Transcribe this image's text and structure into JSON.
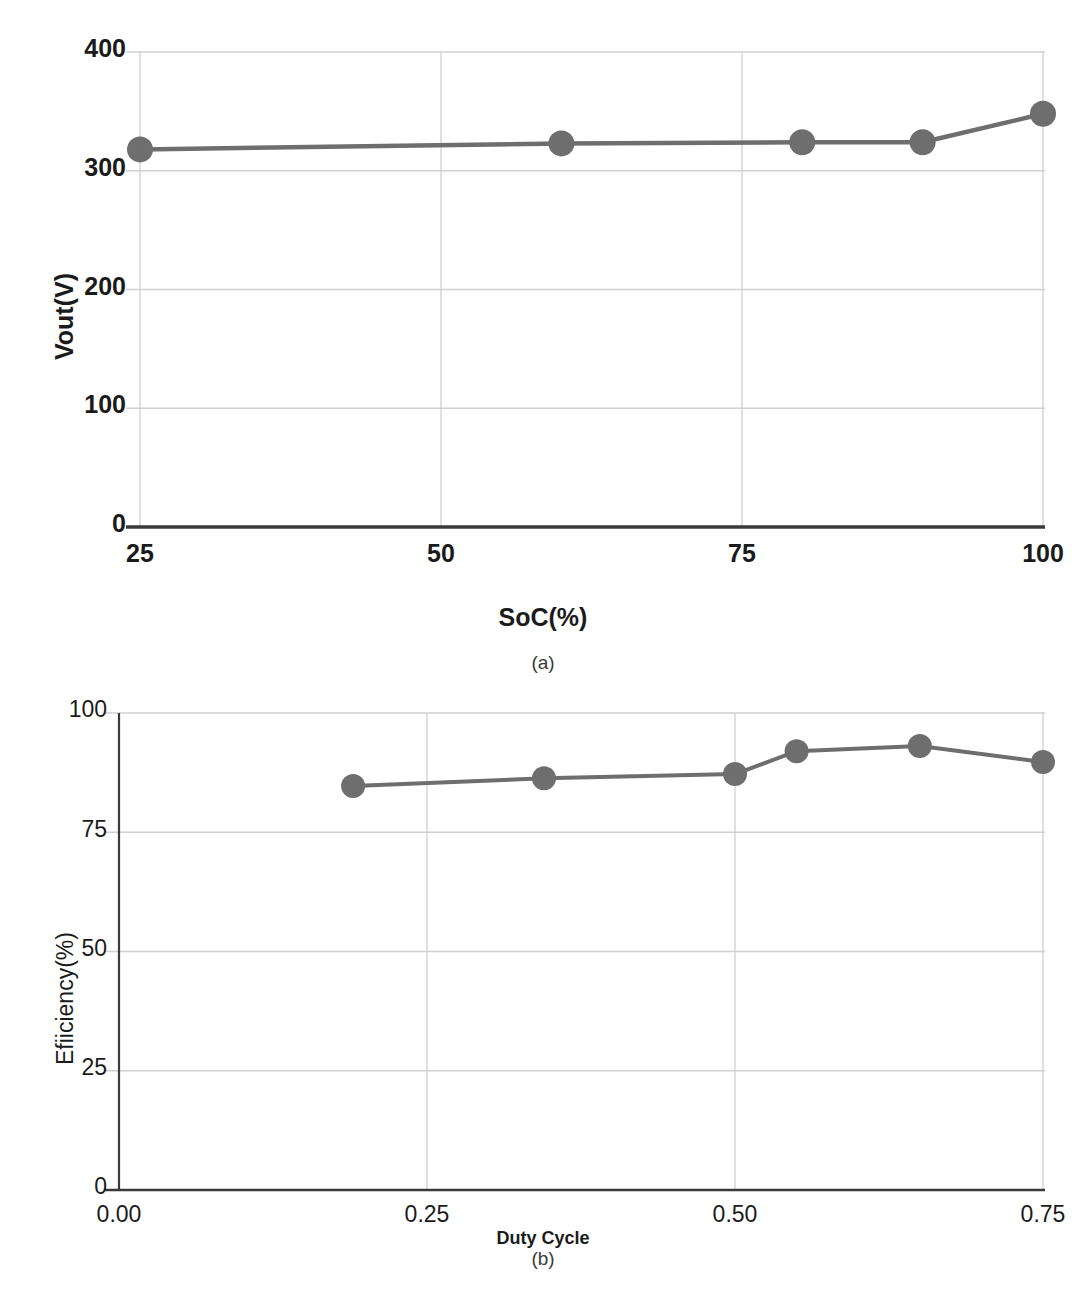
{
  "figure": {
    "caption_a": "(a)",
    "caption_b": "(b)"
  },
  "chart_data": [
    {
      "id": "chart-a",
      "type": "line",
      "title": "",
      "xlabel": "SoC(%)",
      "ylabel": "Vout(V)",
      "xlim": [
        25,
        100
      ],
      "ylim": [
        0,
        400
      ],
      "xticks": [
        "25",
        "50",
        "75",
        "100"
      ],
      "xtick_values": [
        25,
        50,
        75,
        100
      ],
      "yticks": [
        "0",
        "100",
        "200",
        "300",
        "400"
      ],
      "ytick_values": [
        0,
        100,
        200,
        300,
        400
      ],
      "grid": true,
      "legend": "none",
      "marker": "circle",
      "series": [
        {
          "name": "Vout",
          "color": "#6e6e6e",
          "x": [
            25,
            60,
            80,
            90,
            100
          ],
          "values": [
            318,
            323,
            324,
            324,
            348
          ]
        }
      ]
    },
    {
      "id": "chart-b",
      "type": "line",
      "title": "",
      "xlabel": "Duty Cycle",
      "ylabel": "Efiiciency(%)",
      "xlim": [
        0.0,
        0.75
      ],
      "ylim": [
        0,
        100
      ],
      "xticks": [
        "0.00",
        "0.25",
        "0.50",
        "0.75"
      ],
      "xtick_values": [
        0.0,
        0.25,
        0.5,
        0.75
      ],
      "yticks": [
        "0",
        "25",
        "50",
        "75",
        "100"
      ],
      "ytick_values": [
        0,
        25,
        50,
        75,
        100
      ],
      "grid": true,
      "legend": "none",
      "marker": "circle",
      "series": [
        {
          "name": "Efficiency",
          "color": "#6e6e6e",
          "x": [
            0.19,
            0.345,
            0.5,
            0.55,
            0.65,
            0.75
          ],
          "values": [
            84.7,
            86.3,
            87.2,
            92.0,
            93.1,
            89.7
          ]
        }
      ]
    }
  ],
  "style": {
    "series_color": "#6e6e6e",
    "grid_color": "#d0d0d0",
    "axis_color": "#3a3a3a",
    "text_color": "#1b1b1b"
  }
}
